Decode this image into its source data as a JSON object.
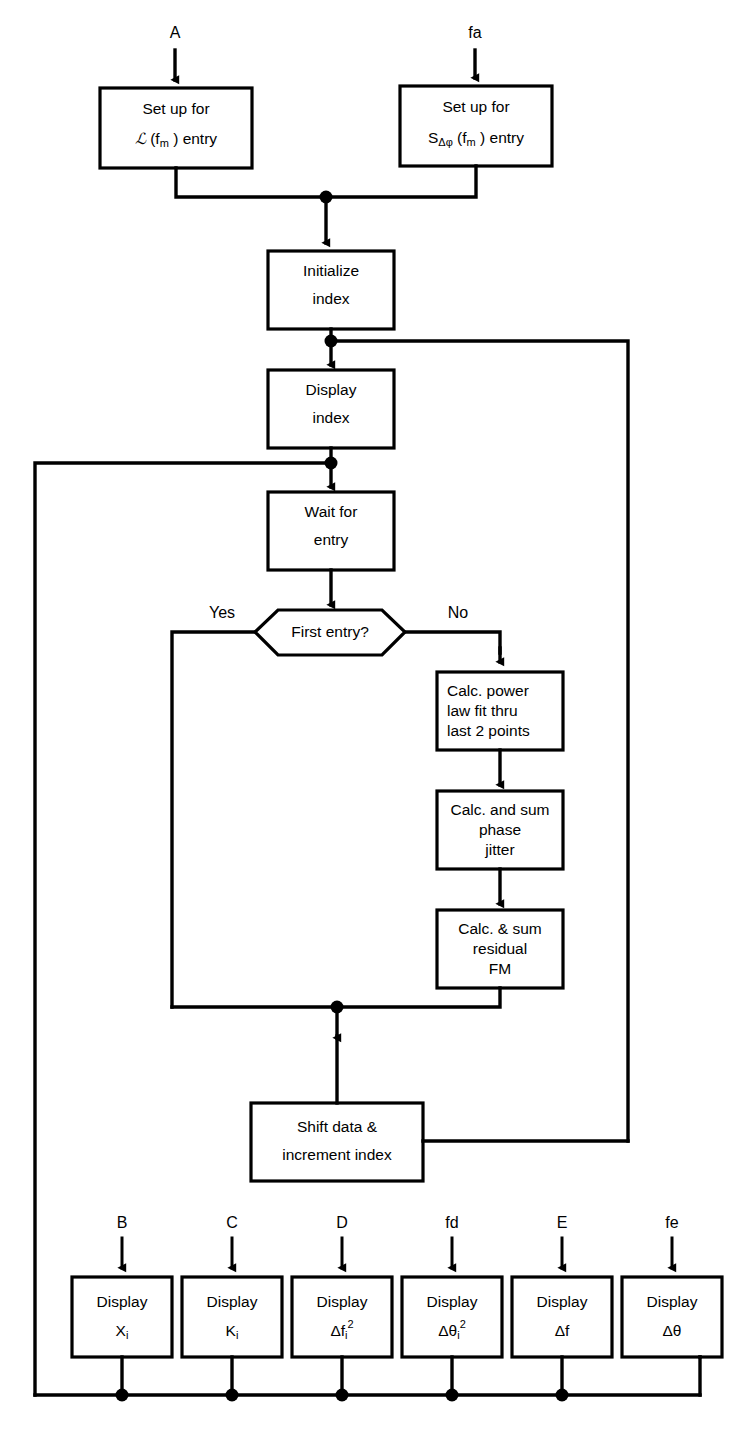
{
  "diagram": {
    "background_color": "#ffffff",
    "line_color": "#000000"
  },
  "entry_ports": [
    {
      "id": "A",
      "label": "A",
      "x": 175,
      "y": 38
    },
    {
      "id": "fa",
      "label": "fa",
      "x": 475,
      "y": 38
    }
  ],
  "bottom_ports": [
    {
      "id": "B",
      "label": "B",
      "x": 122
    },
    {
      "id": "C",
      "label": "C",
      "x": 232
    },
    {
      "id": "D",
      "label": "D",
      "x": 342
    },
    {
      "id": "fd",
      "label": "fd",
      "x": 452
    },
    {
      "id": "E",
      "label": "E",
      "x": 562
    },
    {
      "id": "fe",
      "label": "fe",
      "x": 672
    }
  ],
  "nodes": {
    "setup_script_l": {
      "shape": "process",
      "lines": [
        "Set up for",
        "ℒ (f_m ) entry"
      ],
      "line1": "Set up for",
      "line2_parts": {
        "main": "ℒ (f",
        "sub": "m",
        "tail": " ) entry"
      }
    },
    "setup_s_dphi": {
      "shape": "process",
      "line1": "Set up for",
      "line2_parts": {
        "lead": "S",
        "sub1": "Δφ",
        "main": " (f",
        "sub2": "m",
        "tail": " ) entry"
      }
    },
    "initialize_index": {
      "shape": "process",
      "line1": "Initialize",
      "line2": "index"
    },
    "display_index": {
      "shape": "process",
      "line1": "Display",
      "line2": "index"
    },
    "wait_for_entry": {
      "shape": "process",
      "line1": "Wait for",
      "line2": "entry"
    },
    "first_entry_decision": {
      "shape": "hexagon",
      "label": "First entry?",
      "yes_label": "Yes",
      "no_label": "No"
    },
    "calc_power_law": {
      "shape": "process",
      "line1": "Calc. power",
      "line2": "law fit thru",
      "line3": "last 2 points"
    },
    "calc_phase_jitter": {
      "shape": "process",
      "line1": "Calc. and sum",
      "line2": "phase",
      "line3": "jitter"
    },
    "calc_residual_fm": {
      "shape": "process",
      "line1": "Calc. & sum",
      "line2": "residual",
      "line3": "FM"
    },
    "shift_data": {
      "shape": "process",
      "line1": "Shift data &",
      "line2": "increment index"
    }
  },
  "display_row": [
    {
      "id": "display_xi",
      "line1": "Display",
      "base": "X",
      "sub": "i",
      "sup": ""
    },
    {
      "id": "display_ki",
      "line1": "Display",
      "base": "K",
      "sub": "i",
      "sup": ""
    },
    {
      "id": "display_dfi2",
      "line1": "Display",
      "base": "Δf",
      "sub": "i",
      "sup": "2"
    },
    {
      "id": "display_dthetai2",
      "line1": "Display",
      "base": "Δθ",
      "sub": "i",
      "sup": "2"
    },
    {
      "id": "display_df",
      "line1": "Display",
      "base": "Δf",
      "sub": "",
      "sup": ""
    },
    {
      "id": "display_dtheta",
      "line1": "Display",
      "base": "Δθ",
      "sub": "",
      "sup": ""
    }
  ]
}
